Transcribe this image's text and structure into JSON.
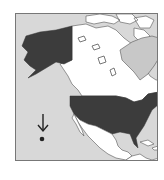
{
  "map": {
    "title": "",
    "region": "North America",
    "highlighted_country": "United States",
    "highlighted_parts": [
      "Contiguous United States",
      "Alaska",
      "Hawaii"
    ],
    "colors": {
      "ocean": "#d8d8d8",
      "highlighted": "#3c3c3c",
      "other_land_light": "#ffffff",
      "other_land_gray": "#c8c8c8",
      "border": "#555555"
    },
    "annotations": [
      {
        "type": "arrow",
        "points_to": "Hawaii",
        "direction": "down"
      }
    ]
  }
}
